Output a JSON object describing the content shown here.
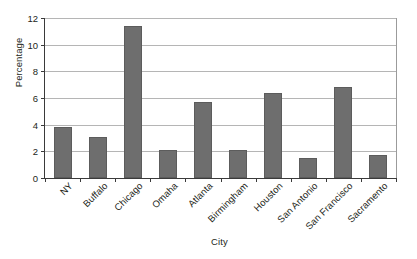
{
  "chart_data": {
    "type": "bar",
    "title": "",
    "xlabel": "City",
    "ylabel": "Percentage",
    "categories": [
      "NY",
      "Buffalo",
      "Chicago",
      "Omaha",
      "Atlanta",
      "Birmingham",
      "Houston",
      "San Antonio",
      "San Francisco",
      "Sacramento"
    ],
    "values": [
      3.8,
      3.1,
      11.4,
      2.1,
      5.7,
      2.1,
      6.4,
      1.5,
      6.8,
      1.7
    ],
    "ylim": [
      0,
      12
    ],
    "ytick_labels": [
      "12",
      "10",
      "8",
      "6",
      "4",
      "2",
      "0"
    ],
    "ytick_values": [
      12,
      10,
      8,
      6,
      4,
      2,
      0
    ],
    "ytick_step": 2,
    "xlim_categories": 10,
    "grid": "horizontal",
    "legend": "none",
    "bar_color": "#6e6e6e",
    "gridline_color": "#b5b5b5",
    "axis_color": "#3a3a3a",
    "background_color": "#ffffff",
    "x_label_rotation_deg": -45
  }
}
